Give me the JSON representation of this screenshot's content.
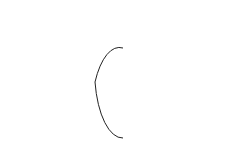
{
  "diagram": {
    "labels": {
      "radius": "a",
      "surface_current_inner": {
        "main": "J",
        "sub": "θ"
      },
      "field": {
        "main": "B",
        "sub": "z"
      },
      "shell_current": {
        "main": "I",
        "sub": "θ"
      }
    },
    "colors": {
      "stroke": "#222222",
      "background": "#ffffff"
    }
  }
}
